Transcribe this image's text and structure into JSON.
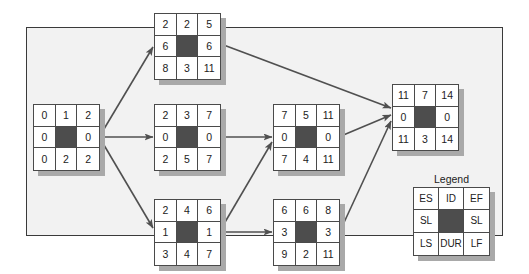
{
  "diagram": {
    "type": "activity-on-node network (critical path method)",
    "colors": {
      "frame_bg": "#f2f2f2",
      "frame_border": "#3a3a3a",
      "node_center": "#4d4d4d",
      "node_shadow": "#a9a9a9",
      "arrow": "#505050"
    },
    "nodes": {
      "start": {
        "es": "0",
        "dur": "2",
        "ef": "2",
        "sl_left": "0",
        "sl_right": "0",
        "ls": "0",
        "id": "1",
        "lf": "2"
      },
      "top": {
        "es": "2",
        "id": "2",
        "ef": "5",
        "sl_left": "6",
        "sl_right": "6",
        "ls": "8",
        "dur": "3",
        "lf": "11"
      },
      "mid": {
        "es": "2",
        "id": "3",
        "ef": "7",
        "sl_left": "0",
        "sl_right": "0",
        "ls": "2",
        "dur": "5",
        "lf": "7"
      },
      "bottom": {
        "es": "2",
        "id": "4",
        "ef": "6",
        "sl_left": "1",
        "sl_right": "1",
        "ls": "3",
        "dur": "4",
        "lf": "7"
      },
      "d": {
        "es": "7",
        "id": "5",
        "ef": "11",
        "sl_left": "0",
        "sl_right": "0",
        "ls": "7",
        "dur": "4",
        "lf": "11"
      },
      "e": {
        "es": "6",
        "id": "6",
        "ef": "8",
        "sl_left": "3",
        "sl_right": "3",
        "ls": "9",
        "dur": "2",
        "lf": "11"
      },
      "end": {
        "es": "11",
        "id": "7",
        "ef": "14",
        "sl_left": "0",
        "sl_right": "0",
        "ls": "11",
        "dur": "3",
        "lf": "14"
      }
    },
    "edges": [
      {
        "from": "1",
        "to": "2"
      },
      {
        "from": "1",
        "to": "3"
      },
      {
        "from": "1",
        "to": "4"
      },
      {
        "from": "2",
        "to": "7"
      },
      {
        "from": "3",
        "to": "5"
      },
      {
        "from": "4",
        "to": "5"
      },
      {
        "from": "4",
        "to": "6"
      },
      {
        "from": "5",
        "to": "7"
      },
      {
        "from": "6",
        "to": "7"
      }
    ],
    "legend": {
      "title": "Legend",
      "es": "ES",
      "id": "ID",
      "ef": "EF",
      "sl_left": "SL",
      "sl_right": "SL",
      "ls": "LS",
      "dur": "DUR",
      "lf": "LF"
    }
  }
}
